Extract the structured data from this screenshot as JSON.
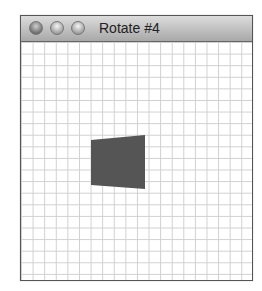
{
  "window": {
    "title": "Rotate #4",
    "buttons": [
      "close",
      "minimize",
      "zoom"
    ]
  },
  "canvas": {
    "grid": true,
    "shape": {
      "type": "quad",
      "fill": "#555555",
      "points": "70,98 124,93 124,147 70,143"
    }
  }
}
